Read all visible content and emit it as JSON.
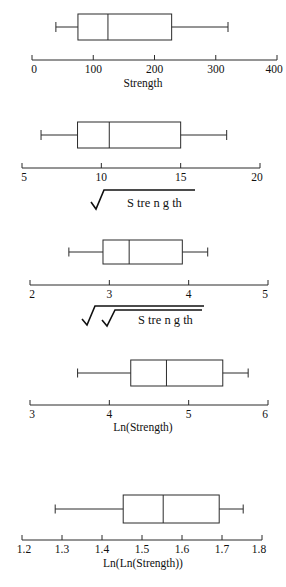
{
  "figure": {
    "type": "boxplot-panel-series",
    "panel_count": 5,
    "background": "#ffffff",
    "line_color": "#2b2b2b"
  },
  "chart_data": [
    {
      "type": "box",
      "id": "panel-strength",
      "title": "",
      "xlabel": "Strength",
      "xlabel_kind": "text",
      "xlim": [
        0,
        400
      ],
      "ticks": [
        0,
        100,
        200,
        300,
        400
      ],
      "tick_labels": [
        "0",
        "100",
        "200",
        "300",
        "400"
      ],
      "grid": false,
      "box": {
        "whisker_low": 39,
        "q1": 75,
        "median": 124,
        "q3": 228,
        "whisker_high": 320
      }
    },
    {
      "type": "box",
      "id": "panel-sqrt-strength",
      "title": "",
      "xlabel": "Strength",
      "xlabel_kind": "sqrt",
      "xlim": [
        5,
        20
      ],
      "ticks": [
        5,
        10,
        15,
        20
      ],
      "tick_labels": [
        "5",
        "10",
        "15",
        "20"
      ],
      "grid": false,
      "box": {
        "whisker_low": 6.2,
        "q1": 8.5,
        "median": 10.5,
        "q3": 15.0,
        "whisker_high": 17.9
      }
    },
    {
      "type": "box",
      "id": "panel-fourth-root-strength",
      "title": "",
      "xlabel": "Strength",
      "xlabel_kind": "sqrt-sqrt",
      "xlim": [
        2,
        5
      ],
      "ticks": [
        2,
        3,
        4,
        5
      ],
      "tick_labels": [
        "2",
        "3",
        "4",
        "5"
      ],
      "grid": false,
      "box": {
        "whisker_low": 2.49,
        "q1": 2.92,
        "median": 3.25,
        "q3": 3.92,
        "whisker_high": 4.24
      }
    },
    {
      "type": "box",
      "id": "panel-ln-strength",
      "title": "",
      "xlabel": "Ln(Strength)",
      "xlabel_kind": "text",
      "xlim": [
        3,
        6
      ],
      "ticks": [
        3,
        4,
        5,
        6
      ],
      "tick_labels": [
        "3",
        "4",
        "5",
        "6"
      ],
      "grid": false,
      "box": {
        "whisker_low": 3.6,
        "q1": 4.27,
        "median": 4.72,
        "q3": 5.43,
        "whisker_high": 5.75
      }
    },
    {
      "type": "box",
      "id": "panel-lnln-strength",
      "title": "",
      "xlabel": "Ln(Ln(Strength))",
      "xlabel_kind": "text",
      "xlim": [
        1.2,
        1.8
      ],
      "ticks": [
        1.2,
        1.3,
        1.4,
        1.5,
        1.6,
        1.7,
        1.8
      ],
      "tick_labels": [
        "1.2",
        "1.3",
        "1.4",
        "1.5",
        "1.6",
        "1.7",
        "1.8"
      ],
      "grid": false,
      "box": {
        "whisker_low": 1.283,
        "q1": 1.453,
        "median": 1.553,
        "q3": 1.693,
        "whisker_high": 1.753
      }
    }
  ],
  "labels": {
    "radical_body": "S tre n g th",
    "strength": "Strength",
    "ln_strength": "Ln(Strength)",
    "lnln_strength": "Ln(Ln(Strength))"
  }
}
